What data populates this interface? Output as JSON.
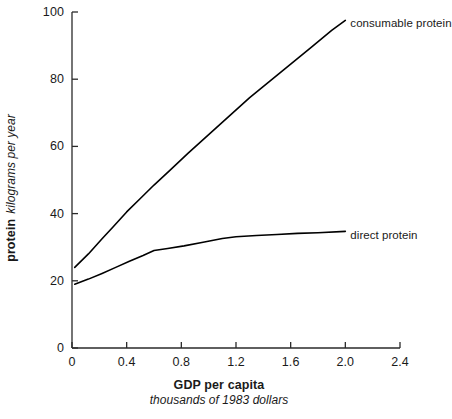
{
  "chart_data": {
    "type": "line",
    "title": "",
    "xlabel": "GDP per capita",
    "xlabel_sub": "thousands of 1983 dollars",
    "ylabel": "protein",
    "ylabel_sub": "kilograms per year",
    "xlim": [
      0,
      2.4
    ],
    "ylim": [
      0,
      100
    ],
    "xticks": [
      0,
      0.4,
      0.8,
      1.2,
      1.6,
      2.0,
      2.4
    ],
    "xtick_labels": [
      "0",
      "0.4",
      "0.8",
      "1.2",
      "1.6",
      "2.0",
      "2.4"
    ],
    "yticks": [
      0,
      20,
      40,
      60,
      80,
      100
    ],
    "ytick_labels": [
      "0",
      "20",
      "40",
      "60",
      "80",
      "100"
    ],
    "grid": false,
    "legend_position": "inline-right-of-curve-ends",
    "line_color": "#000000",
    "series": [
      {
        "name": "consumable protein",
        "label_x": 2.0,
        "label_y": 97.5,
        "x": [
          0.02,
          0.12,
          0.22,
          0.3,
          0.4,
          0.5,
          0.6,
          0.72,
          0.85,
          1.0,
          1.15,
          1.3,
          1.45,
          1.6,
          1.75,
          1.9,
          2.0
        ],
        "y": [
          24.0,
          28.0,
          32.5,
          36.0,
          40.5,
          44.5,
          48.5,
          53.0,
          58.0,
          63.5,
          69.0,
          74.5,
          79.5,
          84.5,
          89.5,
          94.5,
          97.5
        ]
      },
      {
        "name": "direct protein",
        "label_x": 2.0,
        "label_y": 34.5,
        "x": [
          0.02,
          0.12,
          0.22,
          0.32,
          0.42,
          0.52,
          0.6,
          0.7,
          0.82,
          0.95,
          1.1,
          1.2,
          1.35,
          1.5,
          1.65,
          1.8,
          2.0
        ],
        "y": [
          19.0,
          20.5,
          22.2,
          24.0,
          25.8,
          27.5,
          29.0,
          29.6,
          30.4,
          31.4,
          32.6,
          33.1,
          33.5,
          33.8,
          34.1,
          34.3,
          34.7
        ]
      }
    ]
  },
  "axis": {
    "x_title_main": "GDP per capita",
    "x_title_sub": "thousands of 1983 dollars",
    "y_title_main": "protein",
    "y_title_sub": "kilograms per year"
  }
}
